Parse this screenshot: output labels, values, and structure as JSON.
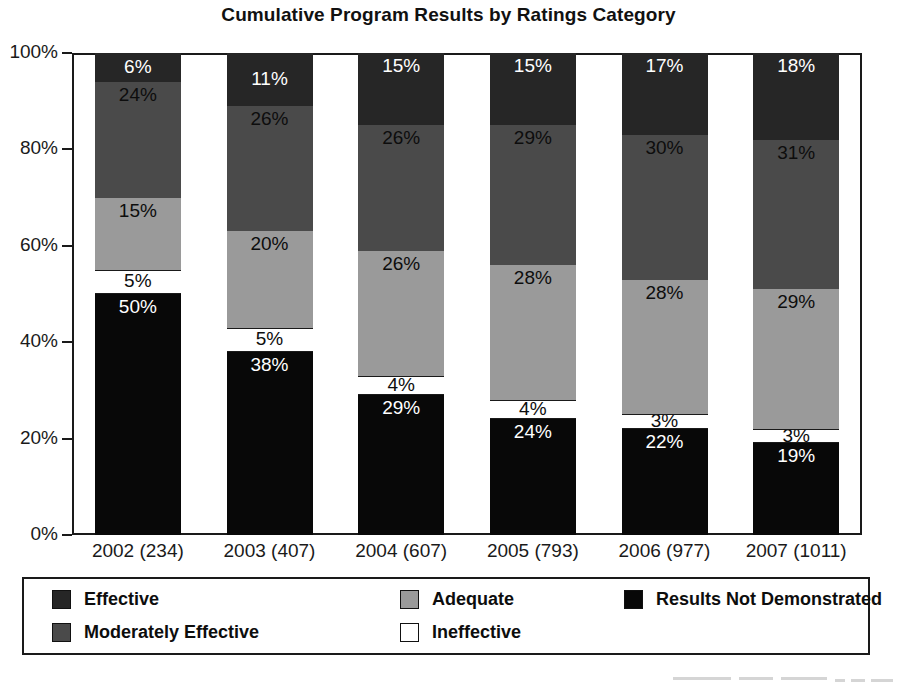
{
  "chart_data": {
    "type": "bar",
    "subtype": "stacked-percent-column",
    "title": "Cumulative Program Results by Ratings Category",
    "xlabel": "",
    "ylabel": "",
    "ylim": [
      0,
      100
    ],
    "y_ticks": [
      "0%",
      "20%",
      "40%",
      "60%",
      "80%",
      "100%"
    ],
    "y_tick_values": [
      0,
      20,
      40,
      60,
      80,
      100
    ],
    "grid": false,
    "legend_position": "bottom",
    "categories": [
      "2002 (234)",
      "2003 (407)",
      "2004 (607)",
      "2005 (793)",
      "2006 (977)",
      "2007 (1011)"
    ],
    "series": [
      {
        "name": "Results Not Demonstrated",
        "color": "#080808",
        "label_color": "#ffffff",
        "values": [
          50,
          38,
          29,
          24,
          22,
          19
        ],
        "value_labels": [
          "50%",
          "38%",
          "29%",
          "24%",
          "22%",
          "19%"
        ]
      },
      {
        "name": "Ineffective",
        "color": "#ffffff",
        "label_color": "#0d0d0d",
        "values": [
          5,
          5,
          4,
          4,
          3,
          3
        ],
        "value_labels": [
          "5%",
          "5%",
          "4%",
          "4%",
          "3%",
          "3%"
        ]
      },
      {
        "name": "Adequate",
        "color": "#9a9a9a",
        "label_color": "#0d0d0d",
        "values": [
          15,
          20,
          26,
          28,
          28,
          29
        ],
        "value_labels": [
          "15%",
          "20%",
          "26%",
          "28%",
          "28%",
          "29%"
        ]
      },
      {
        "name": "Moderately Effective",
        "color": "#4a4a4a",
        "label_color": "#0d0d0d",
        "values": [
          24,
          26,
          26,
          29,
          30,
          31
        ],
        "value_labels": [
          "24%",
          "26%",
          "26%",
          "29%",
          "30%",
          "31%"
        ]
      },
      {
        "name": "Effective",
        "color": "#262626",
        "label_color": "#ffffff",
        "values": [
          6,
          11,
          15,
          15,
          17,
          18
        ],
        "value_labels": [
          "6%",
          "11%",
          "15%",
          "15%",
          "17%",
          "18%"
        ]
      }
    ],
    "legend": [
      {
        "label": "Effective",
        "color": "#262626"
      },
      {
        "label": "Moderately Effective",
        "color": "#4a4a4a"
      },
      {
        "label": "Adequate",
        "color": "#9a9a9a"
      },
      {
        "label": "Ineffective",
        "color": "#ffffff"
      },
      {
        "label": "Results Not Demonstrated",
        "color": "#080808"
      }
    ]
  }
}
